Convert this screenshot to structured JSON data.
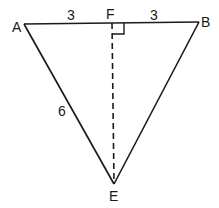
{
  "diagram": {
    "type": "triangle",
    "points": {
      "A": {
        "label": "A",
        "x": 24,
        "y": 24
      },
      "B": {
        "label": "B",
        "x": 199,
        "y": 22
      },
      "F": {
        "label": "F",
        "x": 112,
        "y": 23
      },
      "E": {
        "label": "E",
        "x": 114,
        "y": 184
      }
    },
    "segment_labels": {
      "AF": "3",
      "FB": "3",
      "AE": "6"
    },
    "altitude": {
      "from": "F",
      "to": "E",
      "style": "dashed",
      "right_angle_at": "F"
    },
    "stroke_color": "#1a1a1a"
  }
}
